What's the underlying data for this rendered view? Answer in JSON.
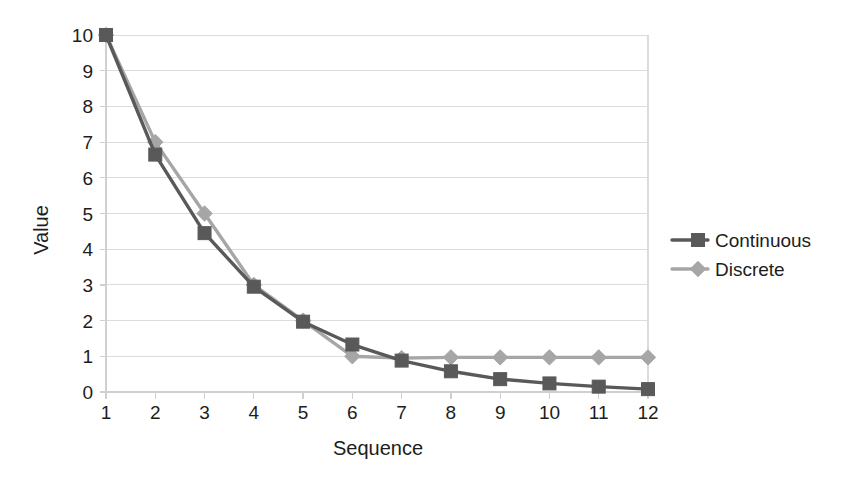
{
  "chart_data": {
    "type": "line",
    "title": "",
    "xlabel": "Sequence",
    "ylabel": "Value",
    "x": [
      1,
      2,
      3,
      4,
      5,
      6,
      7,
      8,
      9,
      10,
      11,
      12
    ],
    "xtick_labels": [
      "1",
      "2",
      "3",
      "4",
      "5",
      "6",
      "7",
      "8",
      "9",
      "10",
      "11",
      "12"
    ],
    "ytick_labels": [
      "0",
      "1",
      "2",
      "3",
      "4",
      "5",
      "6",
      "7",
      "8",
      "9",
      "10"
    ],
    "yticks": [
      0,
      1,
      2,
      3,
      4,
      5,
      6,
      7,
      8,
      9,
      10
    ],
    "xlim": [
      1,
      12
    ],
    "ylim": [
      0,
      10
    ],
    "grid": true,
    "grid_axis": "y",
    "legend_position": "right",
    "series": [
      {
        "name": "Continuous",
        "color": "#595959",
        "marker": "square",
        "values": [
          10.0,
          6.65,
          4.45,
          2.95,
          1.97,
          1.33,
          0.88,
          0.58,
          0.36,
          0.24,
          0.15,
          0.08
        ]
      },
      {
        "name": "Discrete",
        "color": "#a6a6a6",
        "marker": "diamond",
        "values": [
          10.0,
          7.0,
          5.0,
          3.0,
          2.0,
          1.0,
          0.95,
          0.97,
          0.97,
          0.97,
          0.97,
          0.97
        ]
      }
    ],
    "colors": {
      "gridline": "#dcdcdc",
      "axis": "#d0d0d0",
      "text": "#1d1d1d",
      "background": "#ffffff"
    }
  },
  "legend": {
    "items": [
      {
        "label": "Continuous"
      },
      {
        "label": "Discrete"
      }
    ]
  },
  "axes": {
    "x_title": "Sequence",
    "y_title": "Value"
  }
}
